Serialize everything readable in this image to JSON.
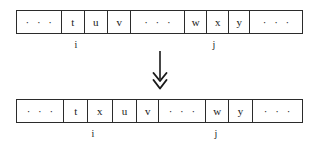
{
  "diagram": {
    "arrow": {
      "icon": "double-chevron-down-arrow",
      "color": "#1a1a1a"
    },
    "colors": {
      "border": "#2b2b2b",
      "text": "#1a1a1a",
      "background": "#ffffff"
    },
    "rows": [
      {
        "name": "before",
        "cells": [
          {
            "text": "· · ·",
            "kind": "ellipsis",
            "width": 48
          },
          {
            "text": "t",
            "kind": "value",
            "width": 24
          },
          {
            "text": "u",
            "kind": "value",
            "width": 25
          },
          {
            "text": "v",
            "kind": "value",
            "width": 25
          },
          {
            "text": "· · ·",
            "kind": "ellipsis",
            "width": 57
          },
          {
            "text": "w",
            "kind": "value",
            "width": 24
          },
          {
            "text": "x",
            "kind": "value",
            "width": 23
          },
          {
            "text": "y",
            "kind": "value",
            "width": 23
          },
          {
            "text": "· · ·",
            "kind": "ellipsis",
            "width": 55
          }
        ],
        "labels": [
          {
            "text": "i",
            "under_cell": 2
          },
          {
            "text": "j",
            "under_cell": 6
          }
        ]
      },
      {
        "name": "after",
        "cells": [
          {
            "text": "· · ·",
            "kind": "ellipsis",
            "width": 48
          },
          {
            "text": "t",
            "kind": "value",
            "width": 24
          },
          {
            "text": "x",
            "kind": "value",
            "width": 25
          },
          {
            "text": "u",
            "kind": "value",
            "width": 25
          },
          {
            "text": "v",
            "kind": "value",
            "width": 22
          },
          {
            "text": "· · ·",
            "kind": "ellipsis",
            "width": 48
          },
          {
            "text": "w",
            "kind": "value",
            "width": 23
          },
          {
            "text": "y",
            "kind": "value",
            "width": 24
          },
          {
            "text": "· · ·",
            "kind": "ellipsis",
            "width": 50
          }
        ],
        "labels": [
          {
            "text": "i",
            "under_cell": 2
          },
          {
            "text": "j",
            "under_cell": 6
          }
        ]
      }
    ]
  }
}
